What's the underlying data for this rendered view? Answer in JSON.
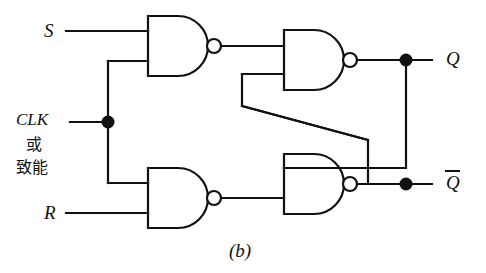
{
  "figure": {
    "caption": "(b)",
    "type": "logic-gate-schematic"
  },
  "labels": {
    "input_s": "S",
    "input_clk": "CLK",
    "clk_line2": "或",
    "clk_line3": "致能",
    "input_r": "R",
    "output_q": "Q",
    "output_qbar": "Q"
  },
  "colors": {
    "line": "#111111",
    "fill": "#ffffff",
    "background": "#ffffff"
  },
  "gates": [
    {
      "name": "nand-gate-s",
      "label": ""
    },
    {
      "name": "nand-gate-r",
      "label": ""
    },
    {
      "name": "nand-gate-q",
      "label": ""
    },
    {
      "name": "nand-gate-qbar",
      "label": ""
    }
  ],
  "junctions": [
    {
      "name": "clk-junction"
    },
    {
      "name": "q-junction"
    },
    {
      "name": "qbar-junction"
    }
  ]
}
